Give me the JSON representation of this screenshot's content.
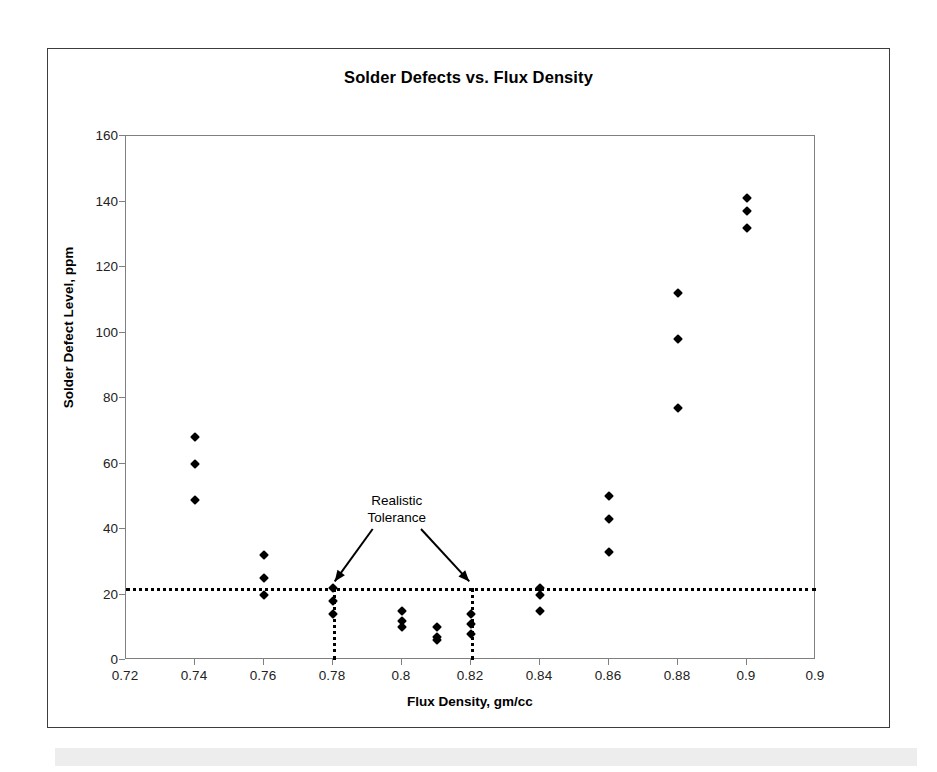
{
  "chart_data": {
    "type": "scatter",
    "title": "Solder Defects vs. Flux Density",
    "xlabel": "Flux Density, gm/cc",
    "ylabel": "Solder Defect Level, ppm",
    "xlim": [
      0.72,
      0.92
    ],
    "ylim": [
      0,
      160
    ],
    "xticks": [
      "0.72",
      "0.74",
      "0.76",
      "0.78",
      "0.8",
      "0.82",
      "0.84",
      "0.86",
      "0.88",
      "0.9",
      "0.9"
    ],
    "xtick_values": [
      0.72,
      0.74,
      0.76,
      0.78,
      0.8,
      0.82,
      0.84,
      0.86,
      0.88,
      0.9,
      0.92
    ],
    "yticks": [
      "0",
      "20",
      "40",
      "60",
      "80",
      "100",
      "120",
      "140",
      "160"
    ],
    "ytick_values": [
      0,
      20,
      40,
      60,
      80,
      100,
      120,
      140,
      160
    ],
    "grid": false,
    "legend": false,
    "marker_shape": "diamond",
    "marker_color": "#000000",
    "points": [
      {
        "x": 0.74,
        "y": 68
      },
      {
        "x": 0.74,
        "y": 60
      },
      {
        "x": 0.74,
        "y": 49
      },
      {
        "x": 0.76,
        "y": 32
      },
      {
        "x": 0.76,
        "y": 25
      },
      {
        "x": 0.76,
        "y": 20
      },
      {
        "x": 0.78,
        "y": 22
      },
      {
        "x": 0.78,
        "y": 18
      },
      {
        "x": 0.78,
        "y": 14
      },
      {
        "x": 0.8,
        "y": 15
      },
      {
        "x": 0.8,
        "y": 12
      },
      {
        "x": 0.8,
        "y": 10
      },
      {
        "x": 0.81,
        "y": 10
      },
      {
        "x": 0.81,
        "y": 7
      },
      {
        "x": 0.81,
        "y": 6
      },
      {
        "x": 0.82,
        "y": 14
      },
      {
        "x": 0.82,
        "y": 11
      },
      {
        "x": 0.82,
        "y": 8
      },
      {
        "x": 0.84,
        "y": 22
      },
      {
        "x": 0.84,
        "y": 20
      },
      {
        "x": 0.84,
        "y": 15
      },
      {
        "x": 0.86,
        "y": 50
      },
      {
        "x": 0.86,
        "y": 43
      },
      {
        "x": 0.86,
        "y": 33
      },
      {
        "x": 0.88,
        "y": 112
      },
      {
        "x": 0.88,
        "y": 98
      },
      {
        "x": 0.88,
        "y": 77
      },
      {
        "x": 0.9,
        "y": 141
      },
      {
        "x": 0.9,
        "y": 137
      },
      {
        "x": 0.9,
        "y": 132
      }
    ],
    "reference_lines": [
      {
        "name": "defect-limit-line",
        "orientation": "horizontal",
        "value": 22,
        "style": "dotted",
        "color": "#000000"
      },
      {
        "name": "tolerance-lower-line",
        "orientation": "vertical",
        "value": 0.78,
        "y_from": 0,
        "y_to": 22,
        "style": "dotted",
        "color": "#000000"
      },
      {
        "name": "tolerance-upper-line",
        "orientation": "vertical",
        "value": 0.82,
        "y_from": 0,
        "y_to": 22,
        "style": "dotted",
        "color": "#000000"
      }
    ],
    "annotations": [
      {
        "name": "realistic-tolerance-annotation",
        "line1": "Realistic",
        "line2": "Tolerance",
        "text_x": 0.7985,
        "text_y": 46,
        "arrows": [
          {
            "from_x": 0.7915,
            "from_y": 40,
            "to_x": 0.7805,
            "to_y": 24
          },
          {
            "from_x": 0.8055,
            "from_y": 40,
            "to_x": 0.8195,
            "to_y": 24
          }
        ]
      }
    ]
  }
}
